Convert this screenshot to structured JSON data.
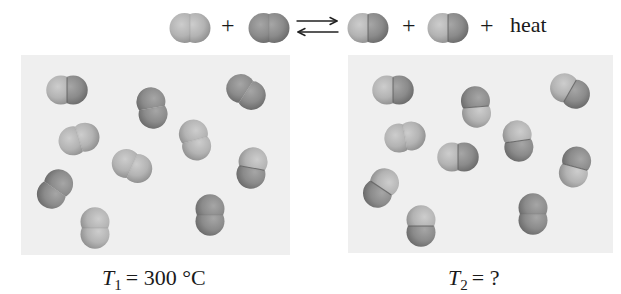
{
  "equation": {
    "plus_1": "+",
    "plus_2": "+",
    "plus_3": "+",
    "heat": "heat",
    "arrow": "equilibrium-double-arrow",
    "molecules": [
      {
        "role": "reactant",
        "x": 190,
        "y": 28,
        "angle": 0,
        "atoms": [
          "light",
          "light"
        ]
      },
      {
        "role": "reactant",
        "x": 269,
        "y": 28,
        "angle": 0,
        "atoms": [
          "dark",
          "dark"
        ]
      },
      {
        "role": "product",
        "x": 368,
        "y": 28,
        "angle": 0,
        "atoms": [
          "light",
          "dark"
        ]
      },
      {
        "role": "product",
        "x": 448,
        "y": 28,
        "angle": 0,
        "atoms": [
          "light",
          "dark"
        ]
      }
    ]
  },
  "panels": [
    {
      "caption": {
        "var": "T",
        "sub": "1",
        "rest": "= 300 °C"
      },
      "molecules": [
        {
          "x": 46,
          "y": 35,
          "angle": 0,
          "atoms": [
            "light",
            "dark"
          ]
        },
        {
          "x": 131,
          "y": 53,
          "angle": 80,
          "atoms": [
            "dark",
            "dark"
          ]
        },
        {
          "x": 225,
          "y": 37,
          "angle": 33,
          "atoms": [
            "dark",
            "dark"
          ]
        },
        {
          "x": 58,
          "y": 84,
          "angle": -17,
          "atoms": [
            "light",
            "light"
          ]
        },
        {
          "x": 174,
          "y": 85,
          "angle": 75,
          "atoms": [
            "light",
            "light"
          ]
        },
        {
          "x": 111,
          "y": 111,
          "angle": 24,
          "atoms": [
            "light",
            "light"
          ]
        },
        {
          "x": 231,
          "y": 113,
          "angle": 100,
          "atoms": [
            "light",
            "dark"
          ]
        },
        {
          "x": 34,
          "y": 134,
          "angle": 125,
          "atoms": [
            "dark",
            "dark"
          ]
        },
        {
          "x": 74,
          "y": 173,
          "angle": 90,
          "atoms": [
            "light",
            "light"
          ]
        },
        {
          "x": 189,
          "y": 160,
          "angle": 90,
          "atoms": [
            "dark",
            "dark"
          ]
        }
      ]
    },
    {
      "caption": {
        "var": "T",
        "sub": "2",
        "rest": "= ?"
      },
      "molecules": [
        {
          "x": 45,
          "y": 35,
          "angle": 0,
          "atoms": [
            "light",
            "dark"
          ]
        },
        {
          "x": 128,
          "y": 52,
          "angle": 85,
          "atoms": [
            "dark",
            "light"
          ]
        },
        {
          "x": 222,
          "y": 36,
          "angle": 30,
          "atoms": [
            "light",
            "dark"
          ]
        },
        {
          "x": 57,
          "y": 82,
          "angle": -10,
          "atoms": [
            "light",
            "light"
          ]
        },
        {
          "x": 170,
          "y": 86,
          "angle": 82,
          "atoms": [
            "light",
            "dark"
          ]
        },
        {
          "x": 110,
          "y": 102,
          "angle": 0,
          "atoms": [
            "light",
            "dark"
          ]
        },
        {
          "x": 227,
          "y": 112,
          "angle": 105,
          "atoms": [
            "dark",
            "light"
          ]
        },
        {
          "x": 33,
          "y": 133,
          "angle": 124,
          "atoms": [
            "light",
            "dark"
          ]
        },
        {
          "x": 73,
          "y": 171,
          "angle": 90,
          "atoms": [
            "light",
            "dark"
          ]
        },
        {
          "x": 185,
          "y": 159,
          "angle": 90,
          "atoms": [
            "dark",
            "dark"
          ]
        }
      ]
    }
  ],
  "colors": {
    "light_atom": {
      "highlight": "#cdcdcd",
      "mid": "#b3b3b3",
      "edge": "#8f8f8f"
    },
    "dark_atom": {
      "highlight": "#a6a6a6",
      "mid": "#8b8b8b",
      "edge": "#6a6a6a"
    },
    "seam": "#5e5e5e",
    "panel_bg": "#efefef"
  }
}
